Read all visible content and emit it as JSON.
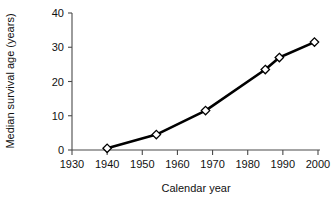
{
  "chart_data": {
    "type": "line",
    "title": "",
    "xlabel": "Calendar year",
    "ylabel": "Median survival age (years)",
    "xlim": [
      1930,
      2000
    ],
    "ylim": [
      0,
      40
    ],
    "xticks": [
      1930,
      1940,
      1950,
      1960,
      1970,
      1980,
      1990,
      2000
    ],
    "xtick_labels": [
      "1930",
      "1940",
      "1950",
      "1960",
      "1970",
      "1980",
      "1990",
      "2000"
    ],
    "yticks": [
      0,
      10,
      20,
      30,
      40
    ],
    "ytick_labels": [
      "0",
      "10",
      "20",
      "30",
      "40"
    ],
    "grid": false,
    "legend": false,
    "marker": "open-diamond",
    "line_color": "#000000",
    "marker_fill": "#ffffff",
    "axis_color": "#4a4a4a",
    "background": "#ffffff",
    "x": [
      1940,
      1954,
      1968,
      1985,
      1989,
      1999
    ],
    "values": [
      0.5,
      4.5,
      11.5,
      23.5,
      27.0,
      31.5
    ],
    "points": [
      {
        "x": 1940,
        "y": 0.5
      },
      {
        "x": 1954,
        "y": 4.5
      },
      {
        "x": 1968,
        "y": 11.5
      },
      {
        "x": 1985,
        "y": 23.5
      },
      {
        "x": 1989,
        "y": 27.0
      },
      {
        "x": 1999,
        "y": 31.5
      }
    ]
  }
}
